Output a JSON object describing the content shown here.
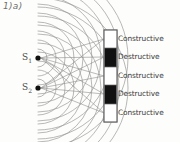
{
  "figure": {
    "label": "1)a)",
    "background_color": "#fdfdfb",
    "ink_color": "#8f8f8f",
    "text_color": "#3a3a3a"
  },
  "sources": [
    {
      "name": "S1",
      "label": "S",
      "subscript": "1",
      "x": 38,
      "y": 58
    },
    {
      "name": "S2",
      "label": "S",
      "subscript": "2",
      "x": 38,
      "y": 88
    }
  ],
  "screen": {
    "x": 104,
    "y": 30,
    "width": 13,
    "height": 92,
    "border_color": "#6a6a6a"
  },
  "bands": [
    {
      "type": "constructive",
      "label": "Constructive",
      "fill": "#ffffff",
      "y": 30,
      "height": 18
    },
    {
      "type": "destructive",
      "label": "Destructive",
      "fill": "#111111",
      "y": 48,
      "height": 19
    },
    {
      "type": "constructive",
      "label": "Constructive",
      "fill": "#ffffff",
      "y": 67,
      "height": 18
    },
    {
      "type": "destructive",
      "label": "Destructive",
      "fill": "#111111",
      "y": 85,
      "height": 19
    },
    {
      "type": "constructive",
      "label": "Constructive",
      "fill": "#ffffff",
      "y": 104,
      "height": 18
    }
  ],
  "wavefronts": {
    "description": "concentric circular arcs radiating from each source",
    "count_per_source": 9,
    "spacing": 9
  },
  "rays": {
    "description": "straight lines from each source to the centre of each band",
    "count": 10
  }
}
